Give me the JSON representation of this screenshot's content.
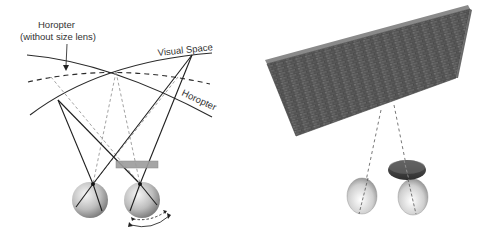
{
  "left_panel": {
    "labels": {
      "horopter_without_lens_line1": "Horopter",
      "horopter_without_lens_line2": "(without size lens)",
      "visual_space": "Visual Space",
      "horopter": "Horopter"
    },
    "elements": {
      "curves": [
        "Horopter (solid)",
        "Visual Space (solid)",
        "Horopter without size lens (dashed)"
      ],
      "eyes": [
        "left eye",
        "right eye"
      ],
      "lens": "size lens (gray bar) in front of right eye",
      "rotation_arrows": "double curved arrows below right eye"
    }
  },
  "right_panel": {
    "elements": {
      "wall": "textured brick wall in perspective",
      "eyes": [
        "left eye",
        "right eye with size lens"
      ],
      "sight_lines": "dashed lines from eyes to wall"
    }
  },
  "colors": {
    "line": "#222222",
    "dashed_light": "#8a8a8a",
    "lens": "#9a9a9a",
    "wall_dark": "#3c3c3c",
    "wall_light": "#7a7a7a"
  }
}
